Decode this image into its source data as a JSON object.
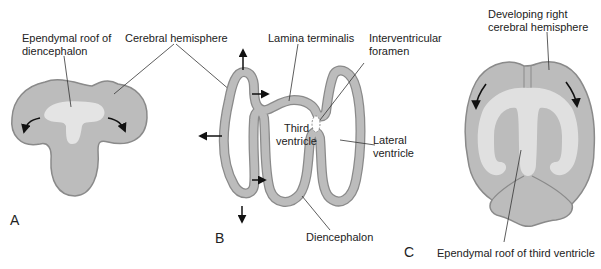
{
  "colors": {
    "tissue": "#bcbcbc",
    "outline": "#8a8a8a",
    "ependyma": "#e4e4e4",
    "line": "#333333",
    "arrow": "#111111",
    "text": "#222222"
  },
  "panels": {
    "A": {
      "letter": "A",
      "labels": {
        "ependymal_roof": [
          "Ependymal roof of",
          "diencephalon"
        ],
        "cerebral_hemisphere": "Cerebral hemisphere"
      }
    },
    "B": {
      "letter": "B",
      "labels": {
        "lamina_terminalis": "Lamina terminalis",
        "interventricular_foramen": [
          "Interventricular",
          "foramen"
        ],
        "third_ventricle": [
          "Third",
          "ventricle"
        ],
        "lateral_ventricle": [
          "Lateral",
          "ventricle"
        ],
        "diencephalon": "Diencephalon"
      }
    },
    "C": {
      "letter": "C",
      "labels": {
        "developing_right_hemisphere": [
          "Developing right",
          "cerebral hemisphere"
        ],
        "ependymal_roof_third_ventricle": "Ependymal roof of third ventricle"
      }
    }
  }
}
